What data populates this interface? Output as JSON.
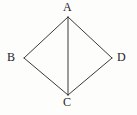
{
  "figure": {
    "type": "geometry-diagram",
    "width": 137,
    "height": 115,
    "background_color": "#fdfdfc",
    "stroke_color": "#3a3a3a",
    "stroke_width": 1,
    "label_color": "#1c1c1c",
    "vertices": [
      {
        "id": "A",
        "label": "A",
        "x": 68,
        "y": 17,
        "label_x": 63,
        "label_y": 1
      },
      {
        "id": "B",
        "label": "B",
        "x": 24,
        "y": 58,
        "label_x": 7,
        "label_y": 51
      },
      {
        "id": "C",
        "label": "C",
        "x": 68,
        "y": 95,
        "label_x": 63,
        "label_y": 96
      },
      {
        "id": "D",
        "label": "D",
        "x": 112,
        "y": 58,
        "label_x": 117,
        "label_y": 51
      }
    ],
    "segments": [
      {
        "id": "AB",
        "from": "A",
        "to": "B",
        "x1": 68,
        "y1": 17,
        "x2": 24,
        "y2": 58
      },
      {
        "id": "BC",
        "from": "B",
        "to": "C",
        "x1": 24,
        "y1": 58,
        "x2": 68,
        "y2": 95
      },
      {
        "id": "CD",
        "from": "C",
        "to": "D",
        "x1": 68,
        "y1": 95,
        "x2": 112,
        "y2": 58
      },
      {
        "id": "DA",
        "from": "D",
        "to": "A",
        "x1": 112,
        "y1": 58,
        "x2": 68,
        "y2": 17
      },
      {
        "id": "AC",
        "from": "A",
        "to": "C",
        "x1": 68,
        "y1": 17,
        "x2": 68,
        "y2": 95
      }
    ]
  }
}
